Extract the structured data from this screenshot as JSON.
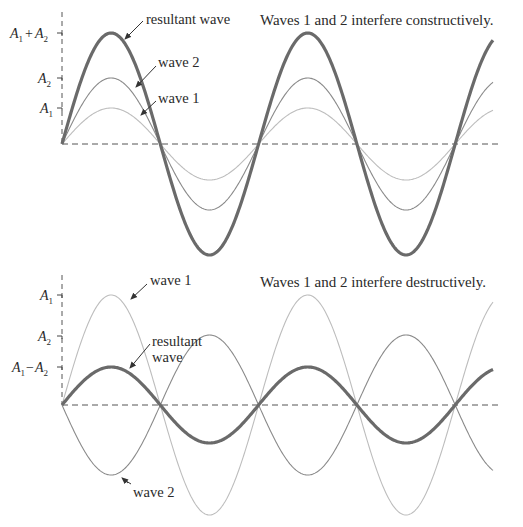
{
  "panels": [
    {
      "id": "constructive",
      "caption": "Waves 1 and 2 interfere constructively.",
      "axis": {
        "x": 62,
        "baseline_y": 144,
        "top_y": 12,
        "ticks": [
          {
            "label_main": "A",
            "sub": "1",
            "plus": "+",
            "label_main2": "A",
            "sub2": "2",
            "y": 33
          },
          {
            "label_main": "A",
            "sub": "2",
            "y": 78
          },
          {
            "label_main": "A",
            "sub": "1",
            "y": 108
          }
        ]
      },
      "labels": {
        "resultant": "resultant wave",
        "wave2": "wave 2",
        "wave1": "wave 1"
      }
    },
    {
      "id": "destructive",
      "caption": "Waves 1 and 2 interfere destructively.",
      "axis": {
        "x": 62,
        "baseline_y": 405,
        "top_y": 275,
        "ticks": [
          {
            "label_main": "A",
            "sub": "1",
            "y": 295
          },
          {
            "label_main": "A",
            "sub": "2",
            "y": 336
          },
          {
            "label_main": "A",
            "sub": "1",
            "minus": "−",
            "label_main2": "A",
            "sub2": "2",
            "y": 367
          }
        ]
      },
      "labels": {
        "wave1": "wave 1",
        "resultant_line1": "resultant",
        "resultant_line2": "wave",
        "wave2": "wave 2"
      }
    }
  ],
  "chart_data": [
    {
      "type": "line",
      "title": "Waves 1 and 2 interfere constructively.",
      "x_start": 62,
      "x_end": 493,
      "half_period_px": 98.3,
      "series": [
        {
          "name": "resultant wave",
          "amplitude": "A1 + A2",
          "amp_px": 111,
          "phase": 0,
          "color": "#6a6a6a",
          "width": 3.2
        },
        {
          "name": "wave 2",
          "amplitude": "A2",
          "amp_px": 66,
          "phase": 0,
          "color": "#8a8a8a",
          "width": 1.1
        },
        {
          "name": "wave 1",
          "amplitude": "A1",
          "amp_px": 36,
          "phase": 0,
          "color": "#bdbdbd",
          "width": 1.1
        }
      ],
      "ylabel_ticks": [
        "A1 + A2",
        "A2",
        "A1"
      ],
      "baseline": "dashed"
    },
    {
      "type": "line",
      "title": "Waves 1 and 2 interfere destructively.",
      "x_start": 62,
      "x_end": 493,
      "half_period_px": 98.3,
      "series": [
        {
          "name": "wave 1",
          "amplitude": "A1",
          "amp_px": 110,
          "phase": 0,
          "color": "#bdbdbd",
          "width": 1.1
        },
        {
          "name": "wave 2",
          "amplitude": "A2",
          "amp_px": 70,
          "phase": 180,
          "color": "#8a8a8a",
          "width": 1.1
        },
        {
          "name": "resultant wave",
          "amplitude": "A1 − A2",
          "amp_px": 38,
          "phase": 0,
          "color": "#6a6a6a",
          "width": 3.2
        }
      ],
      "ylabel_ticks": [
        "A1",
        "A2",
        "A1 − A2"
      ],
      "baseline": "dashed"
    }
  ],
  "colors": {
    "axis": "#555555",
    "text": "#2a2a2a",
    "arrow": "#333333"
  }
}
